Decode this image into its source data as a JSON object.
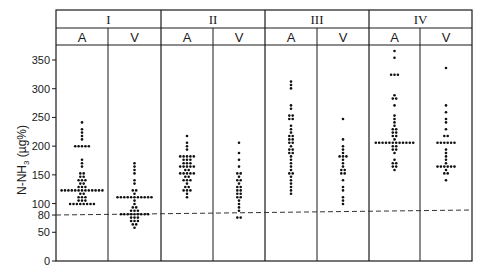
{
  "chart_data": {
    "type": "scatter",
    "subtype": "dot-plot (beeswarm) grouped by stage and vessel",
    "title": "",
    "xlabel": "",
    "ylabel": "N-NH3 (µg%)",
    "ylim": [
      0,
      375
    ],
    "yticks": [
      0,
      50,
      80,
      100,
      150,
      200,
      250,
      300,
      350
    ],
    "reference_line": {
      "y": 80,
      "style": "dashed"
    },
    "groups": [
      {
        "label": "I",
        "subgroups": [
          {
            "label": "A",
            "values": [
              240,
              232,
              225,
              218,
              210,
              200,
              200,
              200,
              200,
              200,
              175,
              170,
              162,
              155,
              150,
              148,
              145,
              142,
              140,
              138,
              135,
              133,
              130,
              128,
              126,
              124,
              122,
              120,
              120,
              120,
              120,
              120,
              120,
              120,
              120,
              120,
              120,
              120,
              118,
              116,
              114,
              112,
              110,
              108,
              106,
              104,
              102,
              100,
              100,
              100,
              100,
              100,
              100,
              100
            ]
          },
          {
            "label": "V",
            "values": [
              172,
              166,
              160,
              154,
              142,
              132,
              125,
              120,
              118,
              112,
              112,
              112,
              112,
              112,
              112,
              112,
              112,
              112,
              112,
              112,
              105,
              100,
              96,
              92,
              90,
              88,
              86,
              84,
              82,
              80,
              80,
              80,
              80,
              80,
              80,
              80,
              78,
              76,
              74,
              72,
              70,
              68,
              66,
              62,
              56
            ]
          }
        ]
      },
      {
        "label": "II",
        "subgroups": [
          {
            "label": "A",
            "values": [
              218,
              208,
              200,
              192,
              185,
              185,
              185,
              185,
              180,
              175,
              175,
              175,
              172,
              170,
              168,
              165,
              165,
              165,
              165,
              162,
              160,
              158,
              155,
              155,
              155,
              152,
              150,
              148,
              145,
              142,
              140,
              138,
              135,
              130,
              128,
              125,
              122,
              120,
              116,
              112
            ]
          },
          {
            "label": "V",
            "values": [
              204,
              186,
              175,
              165,
              155,
              150,
              148,
              142,
              138,
              135,
              130,
              128,
              125,
              120,
              118,
              115,
              112,
              110,
              105,
              100,
              95,
              90,
              78,
              78
            ]
          }
        ]
      },
      {
        "label": "III",
        "subgroups": [
          {
            "label": "A",
            "values": [
              312,
              305,
              298,
              272,
              267,
              252,
              252,
              248,
              248,
              238,
              230,
              225,
              220,
              215,
              212,
              210,
              208,
              205,
              200,
              196,
              192,
              190,
              188,
              185,
              178,
              172,
              165,
              160,
              155,
              150,
              145,
              140,
              132,
              126,
              122,
              115
            ]
          },
          {
            "label": "V",
            "values": [
              245,
              212,
              202,
              196,
              190,
              185,
              182,
              180,
              178,
              170,
              165,
              160,
              158,
              155,
              150,
              140,
              130,
              120,
              112,
              105,
              100
            ]
          }
        ]
      },
      {
        "label": "IV",
        "subgroups": [
          {
            "label": "A",
            "values": [
              368,
              355,
              322,
              322,
              322,
              290,
              280,
              280,
              270,
              255,
              248,
              242,
              238,
              232,
              228,
              225,
              222,
              218,
              215,
              210,
              208,
              206,
              206,
              206,
              206,
              206,
              206,
              206,
              206,
              206,
              206,
              206,
              202,
              198,
              196,
              192,
              188,
              175,
              170,
              168,
              165,
              162,
              158
            ]
          },
          {
            "label": "V",
            "values": [
              338,
              268,
              258,
              248,
              242,
              232,
              220,
              218,
              206,
              206,
              206,
              206,
              206,
              206,
              195,
              188,
              182,
              175,
              168,
              166,
              166,
              166,
              166,
              166,
              162,
              158,
              155,
              150,
              140
            ]
          }
        ]
      }
    ]
  },
  "axis": {
    "ylabel_main": "N-NH",
    "ylabel_sub": "3",
    "ylabel_unit": " (µg%)",
    "tick_labels": [
      "350",
      "300",
      "250",
      "200",
      "150",
      "100",
      "80",
      "50",
      "0"
    ]
  },
  "header": {
    "groups": [
      "I",
      "II",
      "III",
      "IV"
    ],
    "subgroups": [
      "A",
      "V",
      "A",
      "V",
      "A",
      "V",
      "A",
      "V"
    ]
  },
  "colors": {
    "line": "#1a1a1a",
    "dot": "#111111",
    "background": "#ffffff"
  }
}
